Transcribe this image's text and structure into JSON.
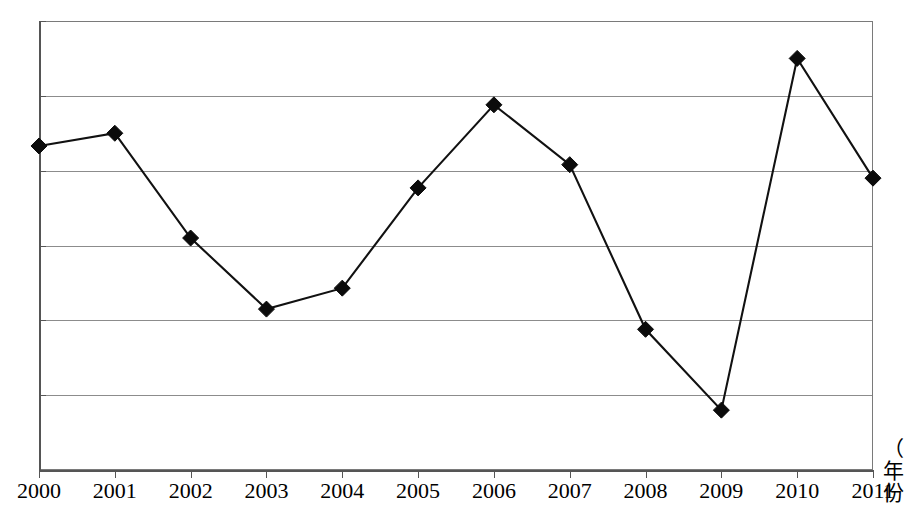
{
  "chart_data": {
    "type": "line",
    "title": "",
    "subtitle": "",
    "xlabel": "（年份）",
    "xlabel_chars": "（\n年\n份",
    "ylabel": "",
    "categories": [
      "2000",
      "2001",
      "2002",
      "2003",
      "2004",
      "2005",
      "2006",
      "2007",
      "2008",
      "2009",
      "2010",
      "2011"
    ],
    "values": [
      73.3,
      75.0,
      61.0,
      51.5,
      54.3,
      67.7,
      78.8,
      70.8,
      48.8,
      38.0,
      85.0,
      69.0
    ],
    "series": [
      {
        "name": "",
        "values": [
          73.3,
          75.0,
          61.0,
          51.5,
          54.3,
          67.7,
          78.8,
          70.8,
          48.8,
          38.0,
          85.0,
          69.0
        ],
        "marker": "diamond",
        "color": "#0b0b0b"
      }
    ],
    "ylim": [
      30,
      90
    ],
    "yticks": [
      30,
      40,
      50,
      60,
      70,
      80,
      90
    ],
    "ytick_labels": [
      "30",
      "40",
      "50",
      "60",
      "70",
      "80",
      "90"
    ],
    "xticks": [
      "2000",
      "2001",
      "2002",
      "2003",
      "2004",
      "2005",
      "2006",
      "2007",
      "2008",
      "2009",
      "2010",
      "2011"
    ],
    "grid": true,
    "grid_axis": "y",
    "grid_color": "#8c8c8c",
    "legend": false,
    "legend_position": "none",
    "plot_border": true,
    "background_color": "#ffffff",
    "line_color": "#111111",
    "marker_color": "#0b0b0b"
  },
  "axis_caption": {
    "char_1": "（",
    "char_2": "年",
    "char_3": "份"
  }
}
